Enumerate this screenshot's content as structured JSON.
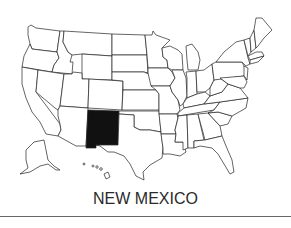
{
  "map": {
    "title": "United States map",
    "highlighted_state": "New Mexico",
    "highlight_color": "#111111",
    "outline_color": "#222222",
    "fill_color": "#ffffff"
  },
  "caption": {
    "text": "NEW MEXICO"
  }
}
